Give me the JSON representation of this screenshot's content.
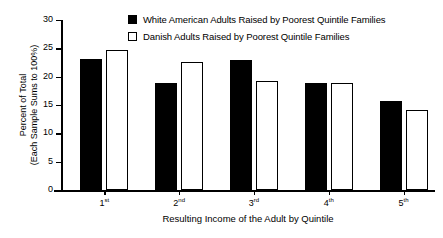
{
  "chart_data": {
    "type": "bar",
    "title": "",
    "xlabel": "Resulting Income of the Adult by Quintile",
    "ylabel_line1": "Percent of Total",
    "ylabel_line2": "(Each Sample Sums to 100%)",
    "categories": [
      "1st",
      "2nd",
      "3rd",
      "4th",
      "5th"
    ],
    "category_ordinals": [
      "st",
      "nd",
      "rd",
      "th",
      "th"
    ],
    "category_bases": [
      "1",
      "2",
      "3",
      "4",
      "5"
    ],
    "series": [
      {
        "name": "White American Adults Raised by Poorest Quintile Families",
        "swatch": "filled",
        "color": "#000000",
        "values": [
          23.2,
          18.9,
          23.0,
          18.8,
          15.7
        ]
      },
      {
        "name": "Danish Adults Raised by Poorest Quintile Families",
        "swatch": "hollow",
        "color": "#ffffff",
        "values": [
          24.7,
          22.6,
          19.3,
          18.8,
          14.1
        ]
      }
    ],
    "ylim": [
      0,
      30
    ],
    "yticks": [
      0,
      5,
      10,
      15,
      20,
      25,
      30
    ],
    "ytick_labels": [
      "0",
      "5",
      "10",
      "15",
      "20",
      "25",
      "30"
    ],
    "grid": false,
    "legend_position": "top-center"
  }
}
